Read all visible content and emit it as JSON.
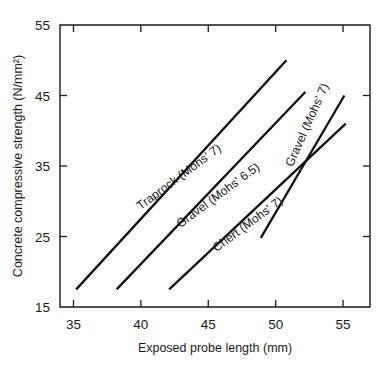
{
  "chart_data": {
    "type": "line",
    "title": "",
    "xlabel": "Exposed probe length (mm)",
    "ylabel": "Concrete compressive strength (N/mm²)",
    "xlim": [
      34.0,
      57.0
    ],
    "ylim": [
      15,
      55
    ],
    "xticks": [
      35,
      40,
      45,
      50,
      55
    ],
    "yticks": [
      15,
      25,
      35,
      45,
      55
    ],
    "xtick_labels": [
      "35",
      "40",
      "45",
      "50",
      "55"
    ],
    "ytick_labels": [
      "15",
      "25",
      "35",
      "45",
      "55"
    ],
    "grid": false,
    "legend": "inline-labels",
    "series": [
      {
        "name": "Traprock (Mohs' 7)",
        "label": "Traprock (Mohs' 7)",
        "x": [
          35.2,
          50.8
        ],
        "y": [
          17.5,
          50.0
        ],
        "label_x": 43.0,
        "label_y": 33.0,
        "label_angle": -36.5
      },
      {
        "name": "Gravel (Mohs' 6.5)",
        "label": "Gravel (Mohs' 6.5)",
        "x": [
          38.2,
          52.2
        ],
        "y": [
          17.5,
          45.5
        ],
        "label_x": 45.9,
        "label_y": 30.4,
        "label_angle": -36.5
      },
      {
        "name": "Chert (Mohs' 7)",
        "label": "Chert (Mohs' 7)",
        "x": [
          42.1,
          55.2
        ],
        "y": [
          17.5,
          41.0
        ],
        "label_x": 48.1,
        "label_y": 26.3,
        "label_angle": -36.5
      },
      {
        "name": "Gravel (Mohs' 7)",
        "label": "Gravel (Mohs' 7)",
        "x": [
          48.9,
          55.1
        ],
        "y": [
          24.8,
          45.0
        ],
        "label_x": 52.6,
        "label_y": 40.6,
        "label_angle": -66.0
      }
    ]
  },
  "figure": {
    "background_color": "#ffffff",
    "line_color": "#111111",
    "axis_color": "#1a1a1a"
  }
}
